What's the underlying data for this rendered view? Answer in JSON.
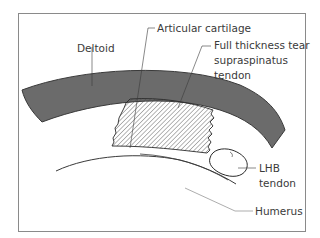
{
  "diagram": {
    "type": "anatomical-cross-section",
    "colors": {
      "frame": "#8a8a8a",
      "deltoid_fill": "#6b6b6b",
      "deltoid_edge": "#3a3a3a",
      "hatch": "#4a4a4a",
      "line": "#3a3a3a",
      "label_text": "#3a3a3a",
      "background": "#ffffff"
    },
    "labels": {
      "deltoid": "Deltoid",
      "articular_cartilage": "Articular cartilage",
      "tear_line1": "Full thickness tear",
      "tear_line2": "supraspinatus",
      "tear_line3": "tendon",
      "lhb_line1": "LHB",
      "lhb_line2": "tendon",
      "humerus": "Humerus"
    },
    "structures": [
      {
        "name": "Deltoid",
        "style": "solid gray band"
      },
      {
        "name": "Supraspinatus tendon (torn)",
        "style": "diagonal hatch"
      },
      {
        "name": "LHB tendon",
        "style": "outlined oval"
      },
      {
        "name": "Humerus",
        "style": "curved outline"
      }
    ]
  }
}
